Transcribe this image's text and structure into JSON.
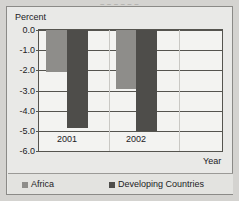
{
  "figure": {
    "clipped_title": "– – – – – –",
    "background_color": "#d4d3d0",
    "card_color": "#e9e9e7"
  },
  "axes": {
    "ylabel": "Percent",
    "xlabel": "Year"
  },
  "legend": {
    "items": [
      {
        "label": "Africa",
        "color": "#8e8d8a",
        "swatch": "africa"
      },
      {
        "label": "Developing Countries",
        "color": "#4e4d4a",
        "swatch": "developing"
      }
    ]
  },
  "chart_data": {
    "type": "bar",
    "title": "",
    "xlabel": "Year",
    "ylabel": "Percent",
    "categories": [
      "2001",
      "2002"
    ],
    "series": [
      {
        "name": "Africa",
        "color": "#8e8d8a",
        "values": [
          -2.1,
          -2.95
        ]
      },
      {
        "name": "Developing Countries",
        "color": "#4e4d4a",
        "values": [
          -4.85,
          -5.0
        ]
      }
    ],
    "ylim": [
      -6.0,
      0.0
    ],
    "yticks": [
      0.0,
      -1.0,
      -2.0,
      -3.0,
      -4.0,
      -5.0,
      -6.0
    ],
    "ytick_labels": [
      "0.0",
      "-1.0",
      "-2.0",
      "-3.0",
      "-4.0",
      "-5.0",
      "-6.0"
    ],
    "xtick_labels": [
      "2001",
      "2002"
    ],
    "grid": true,
    "grid_axis": "y",
    "legend_position": "bottom",
    "orientation": "vertical",
    "bars_direction": "downward-from-zero"
  }
}
